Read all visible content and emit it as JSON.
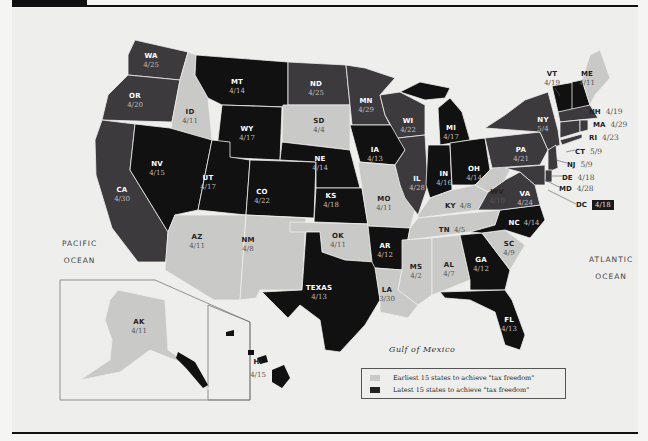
{
  "colors": {
    "background": "#f5f5f3",
    "panel": "#eeeeec",
    "earliest": "#c9c9c7",
    "latest": "#111111",
    "middle": "#3d3a3e",
    "rule": "#111111"
  },
  "oceans": {
    "pacific": [
      "PACIFIC",
      "OCEAN"
    ],
    "atlantic": [
      "ATLANTIC",
      "OCEAN"
    ],
    "gulf": "Gulf of Mexico"
  },
  "legend": {
    "earliest_label": "Earliest 15 states to achieve \"tax freedom\"",
    "latest_label": "Latest 15 states to achieve \"tax freedom\""
  },
  "states": [
    {
      "abbr": "WA",
      "date": "4/25",
      "group": "middle"
    },
    {
      "abbr": "OR",
      "date": "4/20",
      "group": "middle"
    },
    {
      "abbr": "CA",
      "date": "4/30",
      "group": "middle"
    },
    {
      "abbr": "ID",
      "date": "4/11",
      "group": "earliest"
    },
    {
      "abbr": "NV",
      "date": "4/15",
      "group": "latest"
    },
    {
      "abbr": "MT",
      "date": "4/14",
      "group": "latest"
    },
    {
      "abbr": "WY",
      "date": "4/17",
      "group": "latest"
    },
    {
      "abbr": "UT",
      "date": "4/17",
      "group": "latest"
    },
    {
      "abbr": "AZ",
      "date": "4/11",
      "group": "earliest"
    },
    {
      "abbr": "CO",
      "date": "4/22",
      "group": "latest"
    },
    {
      "abbr": "NM",
      "date": "4/8",
      "group": "earliest"
    },
    {
      "abbr": "ND",
      "date": "4/25",
      "group": "middle"
    },
    {
      "abbr": "SD",
      "date": "4/4",
      "group": "earliest"
    },
    {
      "abbr": "NE",
      "date": "4/14",
      "group": "latest"
    },
    {
      "abbr": "KS",
      "date": "4/18",
      "group": "latest"
    },
    {
      "abbr": "OK",
      "date": "4/11",
      "group": "earliest"
    },
    {
      "abbr": "TEXAS",
      "date": "4/13",
      "group": "latest"
    },
    {
      "abbr": "MN",
      "date": "4/29",
      "group": "middle"
    },
    {
      "abbr": "IA",
      "date": "4/13",
      "group": "latest"
    },
    {
      "abbr": "MO",
      "date": "4/11",
      "group": "earliest"
    },
    {
      "abbr": "AR",
      "date": "4/12",
      "group": "latest"
    },
    {
      "abbr": "LA",
      "date": "3/30",
      "group": "earliest"
    },
    {
      "abbr": "WI",
      "date": "4/22",
      "group": "middle"
    },
    {
      "abbr": "IL",
      "date": "4/28",
      "group": "middle"
    },
    {
      "abbr": "MS",
      "date": "4/2",
      "group": "earliest"
    },
    {
      "abbr": "MI",
      "date": "4/17",
      "group": "latest"
    },
    {
      "abbr": "IN",
      "date": "4/16",
      "group": "latest"
    },
    {
      "abbr": "OH",
      "date": "4/14",
      "group": "latest"
    },
    {
      "abbr": "KY",
      "date": "4/8",
      "group": "earliest"
    },
    {
      "abbr": "TN",
      "date": "4/5",
      "group": "earliest"
    },
    {
      "abbr": "AL",
      "date": "4/7",
      "group": "earliest"
    },
    {
      "abbr": "GA",
      "date": "4/12",
      "group": "latest"
    },
    {
      "abbr": "FL",
      "date": "4/13",
      "group": "latest"
    },
    {
      "abbr": "SC",
      "date": "4/9",
      "group": "earliest"
    },
    {
      "abbr": "NC",
      "date": "4/14",
      "group": "latest"
    },
    {
      "abbr": "VA",
      "date": "4/24",
      "group": "middle"
    },
    {
      "abbr": "WV",
      "date": "4/10",
      "group": "earliest"
    },
    {
      "abbr": "PA",
      "date": "4/21",
      "group": "middle"
    },
    {
      "abbr": "NY",
      "date": "5/4",
      "group": "middle"
    },
    {
      "abbr": "VT",
      "date": "4/19",
      "group": "latest"
    },
    {
      "abbr": "ME",
      "date": "4/11",
      "group": "earliest"
    },
    {
      "abbr": "NH",
      "date": "4/19",
      "group": "latest"
    },
    {
      "abbr": "MA",
      "date": "4/29",
      "group": "middle"
    },
    {
      "abbr": "RI",
      "date": "4/23",
      "group": "middle"
    },
    {
      "abbr": "CT",
      "date": "5/9",
      "group": "middle"
    },
    {
      "abbr": "NJ",
      "date": "5/9",
      "group": "middle"
    },
    {
      "abbr": "DE",
      "date": "4/18",
      "group": "middle"
    },
    {
      "abbr": "MD",
      "date": "4/28",
      "group": "middle"
    },
    {
      "abbr": "DC",
      "date": "4/18",
      "group": "latest"
    },
    {
      "abbr": "AK",
      "date": "4/11",
      "group": "earliest"
    },
    {
      "abbr": "HI",
      "date": "4/15",
      "group": "latest"
    }
  ]
}
